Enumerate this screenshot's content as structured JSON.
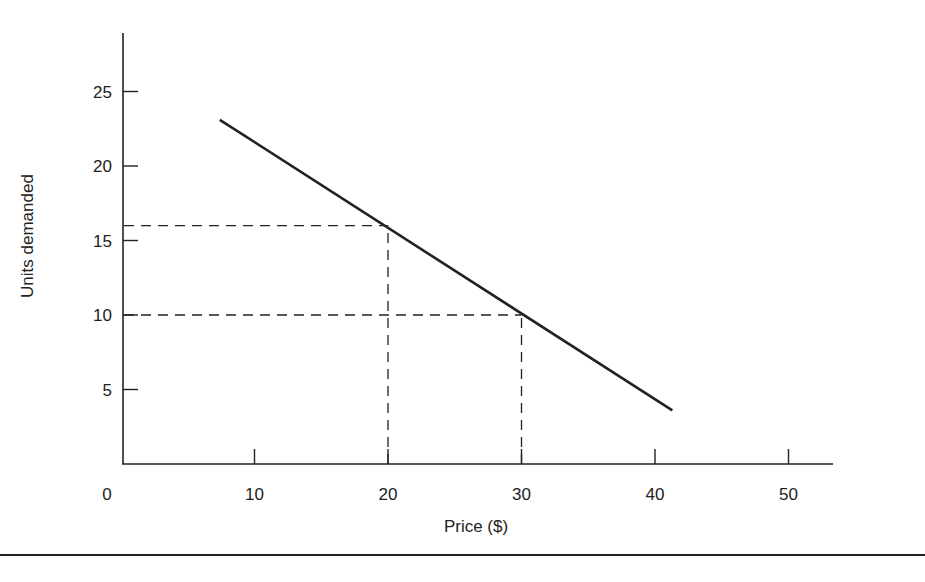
{
  "chart_data": {
    "type": "line",
    "title": "",
    "xlabel": "Price ($)",
    "ylabel": "Units demanded",
    "xlim": [
      0,
      53
    ],
    "ylim": [
      0,
      29
    ],
    "x_ticks": [
      10,
      20,
      30,
      40,
      50
    ],
    "x_tick_labels": [
      "0",
      "10",
      "20",
      "30",
      "40",
      "50"
    ],
    "y_ticks": [
      5,
      10,
      15,
      20,
      25
    ],
    "y_tick_labels": [
      "5",
      "10",
      "15",
      "20",
      "25"
    ],
    "grid": false,
    "legend": null,
    "series": [
      {
        "name": "Demand curve",
        "style": "solid",
        "color": "#222222",
        "points": [
          {
            "x": 7.4,
            "y": 23.1
          },
          {
            "x": 20,
            "y": 16
          },
          {
            "x": 30,
            "y": 10
          },
          {
            "x": 41.3,
            "y": 3.6
          }
        ]
      }
    ],
    "reference_lines": [
      {
        "type": "dashed",
        "from": [
          0,
          16
        ],
        "to": [
          20,
          16
        ]
      },
      {
        "type": "dashed",
        "from": [
          20,
          0
        ],
        "to": [
          20,
          16
        ]
      },
      {
        "type": "dashed",
        "from": [
          0,
          10
        ],
        "to": [
          30,
          10
        ]
      },
      {
        "type": "dashed",
        "from": [
          30,
          0
        ],
        "to": [
          30,
          10
        ]
      }
    ]
  },
  "colors": {
    "ink": "#222222",
    "background": "#ffffff"
  }
}
